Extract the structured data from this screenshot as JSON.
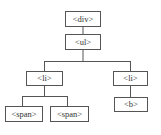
{
  "diagram": {
    "type": "tree",
    "line_color": "#555555",
    "nodes": {
      "div": {
        "label": "<div>"
      },
      "ul": {
        "label": "<ul>"
      },
      "li_left": {
        "label": "<li>"
      },
      "li_right": {
        "label": "<li>"
      },
      "span_1": {
        "label": "<span>"
      },
      "span_2": {
        "label": "<span>"
      },
      "b": {
        "label": "<b>"
      }
    },
    "edges": [
      {
        "from": "div",
        "to": "ul"
      },
      {
        "from": "ul",
        "to": "li_left"
      },
      {
        "from": "ul",
        "to": "li_right"
      },
      {
        "from": "li_left",
        "to": "span_1"
      },
      {
        "from": "li_left",
        "to": "span_2"
      },
      {
        "from": "li_right",
        "to": "b"
      }
    ]
  }
}
